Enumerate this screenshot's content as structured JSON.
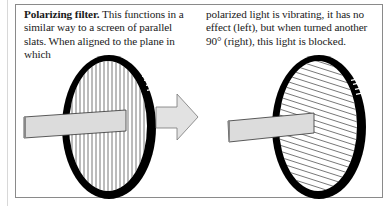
{
  "caption": {
    "title": "Polarizing filter.",
    "column_left": " This functions in a similar way to a screen of parallel slats. When aligned to the plane in which",
    "column_right": "polarized light is vibrating, it has no effect (left), but when turned another 90° (right), this light is blocked."
  },
  "illustration": {
    "left_filter": {
      "state": "aligned",
      "slat_orientation": "vertical",
      "effect": "light passes"
    },
    "arrow": {
      "direction": "right"
    },
    "right_filter": {
      "state": "rotated 90°",
      "slat_orientation": "diagonal",
      "effect": "light blocked"
    },
    "colors": {
      "ring": "#000000",
      "slats": "#555555",
      "beam_fill": "#dcdcdc",
      "beam_edge": "#333333",
      "arrow_fill": "#e2e2e2",
      "frame": "#8a8a8a"
    }
  }
}
